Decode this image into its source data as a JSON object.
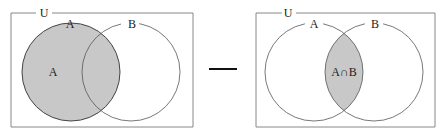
{
  "left_diagram": {
    "universe_label": "U",
    "set_a_label": "A",
    "set_b_label": "B",
    "region_label": "A",
    "shaded_region": "A"
  },
  "operator": {
    "symbol": "minus"
  },
  "right_diagram": {
    "universe_label": "U",
    "set_a_label": "A",
    "set_b_label": "B",
    "region_label": "A∩B",
    "shaded_region": "A∩B"
  },
  "colors": {
    "shade": "#c8c8c8",
    "stroke": "#555555",
    "box": "#777777"
  }
}
